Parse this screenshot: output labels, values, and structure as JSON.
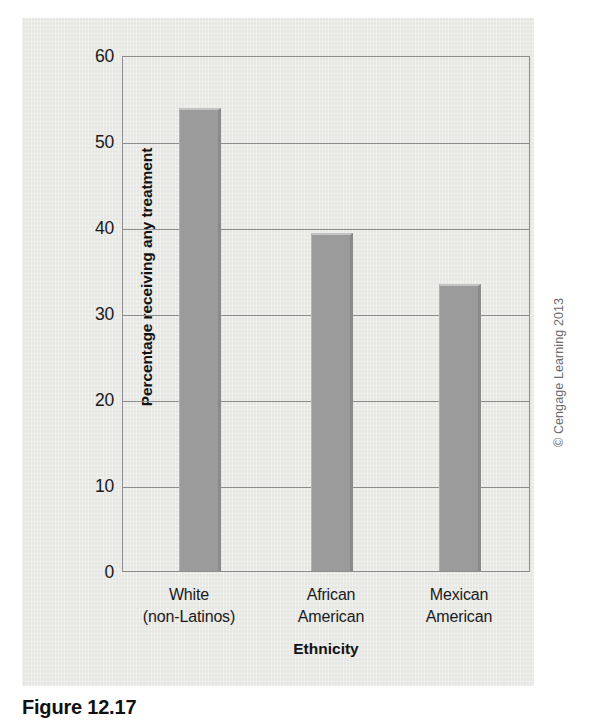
{
  "chart_data": {
    "type": "bar",
    "title": "",
    "categories": [
      "White\n(non-Latinos)",
      "African\nAmerican",
      "Mexican\nAmerican"
    ],
    "category_lines": [
      [
        "White",
        "(non-Latinos)"
      ],
      [
        "African",
        "American"
      ],
      [
        "Mexican",
        "American"
      ]
    ],
    "values": [
      54,
      39.5,
      33.5
    ],
    "xlabel": "Ethnicity",
    "ylabel": "Percentage receiving any treatment",
    "ylim": [
      0,
      60
    ],
    "yticks": [
      60,
      50,
      40,
      30,
      20,
      10,
      0
    ],
    "grid": true,
    "legend": false,
    "bar_color": "#9b9b9b",
    "grid_color": "#8d8d8d",
    "background_color": "#e9e9e6"
  },
  "credit": {
    "text": "© Cengage Learning 2013"
  },
  "caption": {
    "text": "Figure 12.17"
  }
}
